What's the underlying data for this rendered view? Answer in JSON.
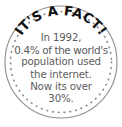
{
  "badge": {
    "name": "its-a-fact-badge",
    "heading": "IT'S A FACT!",
    "body_lines": [
      "In 1992,",
      "0.4% of the world's",
      "population used",
      "the internet.",
      "Now its over",
      "30%."
    ],
    "full_text": "In 1992, 0.4% of the world's population used the internet. Now its over 30%.",
    "facts": {
      "year": "1992",
      "internet_share_1992": "0.4%",
      "internet_share_now": "30%"
    },
    "colors": {
      "background": "#ffffff",
      "heading_text": "#111111",
      "body_text": "#5c5c5c",
      "outer_ring": "#8e8e8e",
      "dotted_ring": "#8e8e8e"
    },
    "shape": "circle",
    "border_style": "solid outer ring with dotted inner ring"
  }
}
